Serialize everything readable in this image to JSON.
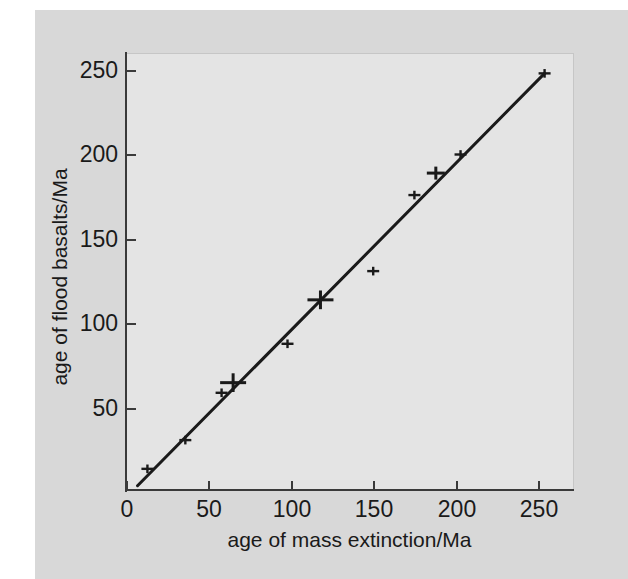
{
  "chart_data": {
    "type": "scatter",
    "title": "",
    "xlabel": "age of mass extinction/Ma",
    "ylabel": "age of flood basalts/Ma",
    "xlim": [
      0,
      265
    ],
    "ylim": [
      0,
      262
    ],
    "xticks": [
      0,
      50,
      100,
      150,
      200,
      250
    ],
    "yticks": [
      50,
      100,
      150,
      200,
      250
    ],
    "xtick_labels": [
      "0",
      "50",
      "100",
      "150",
      "200",
      "250"
    ],
    "ytick_labels": [
      "50",
      "100",
      "150",
      "200",
      "250"
    ],
    "grid": false,
    "legend": null,
    "marker": "plus",
    "marker_color": "#1a1a1a",
    "line_color": "#1a1a1a",
    "points": [
      {
        "x": 13,
        "y": 14,
        "size": "small"
      },
      {
        "x": 36,
        "y": 31,
        "size": "small"
      },
      {
        "x": 58,
        "y": 59,
        "size": "small"
      },
      {
        "x": 65,
        "y": 65,
        "size": "large"
      },
      {
        "x": 98,
        "y": 88,
        "size": "small"
      },
      {
        "x": 118,
        "y": 114,
        "size": "large"
      },
      {
        "x": 150,
        "y": 131,
        "size": "small"
      },
      {
        "x": 175,
        "y": 176,
        "size": "small"
      },
      {
        "x": 188,
        "y": 189,
        "size": "medium"
      },
      {
        "x": 203,
        "y": 200,
        "size": "small"
      },
      {
        "x": 254,
        "y": 248,
        "size": "small"
      }
    ],
    "fit_line": {
      "x0": 7,
      "y0": 4,
      "x1": 254,
      "y1": 248,
      "slope": 0.988,
      "intercept": -2.9
    }
  },
  "figure": {
    "paper_color": "#d8d8d8",
    "plot_background": "#e4e4e4",
    "axis_color": "#3a3a3a",
    "text_color": "#1a1a1a"
  }
}
